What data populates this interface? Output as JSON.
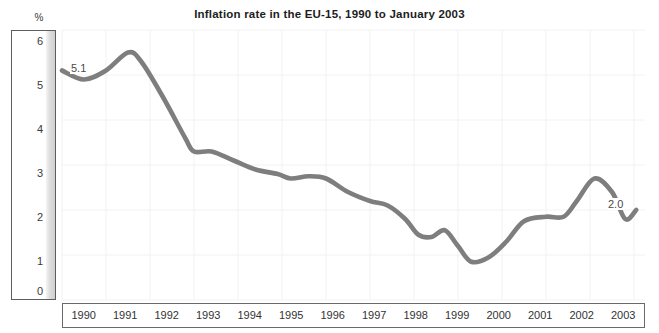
{
  "chart_data": {
    "type": "line",
    "title": "Inflation rate in the EU-15, 1990 to January 2003",
    "xlabel": "",
    "ylabel": "%",
    "y_unit": "%",
    "ylim": [
      0,
      6
    ],
    "yticks": [
      6,
      5,
      4,
      3,
      2,
      1,
      0
    ],
    "ytick_labels": [
      "6",
      "5",
      "4",
      "3",
      "2",
      "1",
      "0"
    ],
    "categories": [
      "1990",
      "1991",
      "1992",
      "1993",
      "1994",
      "1995",
      "1996",
      "1997",
      "1998",
      "1999",
      "2000",
      "2001",
      "2002",
      "2003"
    ],
    "xlim": [
      "1990",
      "2003"
    ],
    "grid": true,
    "legend": "none",
    "series": [
      {
        "name": "Inflation rate EU-15",
        "color": "#7e7e7e",
        "x": [
          1990.0,
          1990.5,
          1991.0,
          1991.5,
          1991.8,
          1992.3,
          1992.8,
          1993.0,
          1993.4,
          1993.9,
          1994.4,
          1994.9,
          1995.2,
          1995.6,
          1996.0,
          1996.5,
          1997.0,
          1997.4,
          1997.8,
          1998.1,
          1998.4,
          1998.7,
          1999.0,
          1999.3,
          1999.7,
          2000.1,
          2000.5,
          2001.0,
          2001.4,
          2001.7,
          2002.1,
          2002.5,
          2002.8,
          2003.05
        ],
        "values": [
          5.1,
          4.9,
          5.1,
          5.5,
          5.3,
          4.5,
          3.6,
          3.3,
          3.3,
          3.1,
          2.9,
          2.8,
          2.7,
          2.75,
          2.7,
          2.4,
          2.2,
          2.1,
          1.8,
          1.45,
          1.4,
          1.55,
          1.2,
          0.85,
          0.95,
          1.3,
          1.75,
          1.85,
          1.85,
          2.2,
          2.7,
          2.4,
          1.8,
          2.0
        ]
      }
    ],
    "annotations": [
      {
        "name": "start-value",
        "text": "5.1",
        "x": "1990",
        "value": 5.1
      },
      {
        "name": "end-value",
        "text": "2.0",
        "x": "2003",
        "value": 2.0
      }
    ]
  },
  "axis": {
    "y_unit_symbol": "%",
    "y_labels": [
      "6",
      "5",
      "4",
      "3",
      "2",
      "1",
      "0"
    ],
    "x_labels": [
      "1990",
      "1991",
      "1992",
      "1993",
      "1994",
      "1995",
      "1996",
      "1997",
      "1998",
      "1999",
      "2000",
      "2001",
      "2002",
      "2003"
    ]
  },
  "labels": {
    "start": "5.1",
    "end": "2.0"
  },
  "colors": {
    "line": "#7e7e7e",
    "axis_border": "#5d5d5d",
    "grid": "#f2f2f2",
    "text": "#333333",
    "title": "#1d1d1d"
  }
}
